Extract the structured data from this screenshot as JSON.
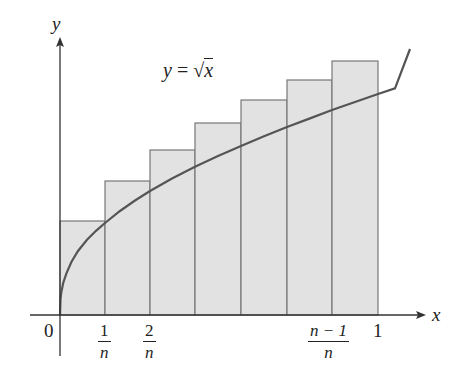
{
  "diagram": {
    "function_label": {
      "lhs": "y",
      "eq": " = ",
      "sqrt": "√",
      "arg": "x"
    },
    "axis_labels": {
      "x": "x",
      "y": "y"
    },
    "tick_labels": {
      "origin": "0",
      "t1": {
        "num": "1",
        "den": "n"
      },
      "t2": {
        "num": "2",
        "den": "n"
      },
      "tn1": {
        "num": "n − 1",
        "den": "n"
      },
      "one": "1"
    },
    "colors": {
      "rect_fill": "#e2e2e2",
      "rect_stroke": "#6f6f6f",
      "curve": "#5a5a5a",
      "axis": "#333333"
    },
    "rectangles": {
      "count": 7,
      "type": "upper Riemann sum (right endpoints)",
      "x_boundaries_px": [
        60,
        105,
        150,
        195,
        241,
        287,
        332,
        378
      ],
      "tops_px": [
        221,
        181,
        150,
        123,
        100,
        80,
        61
      ]
    }
  }
}
